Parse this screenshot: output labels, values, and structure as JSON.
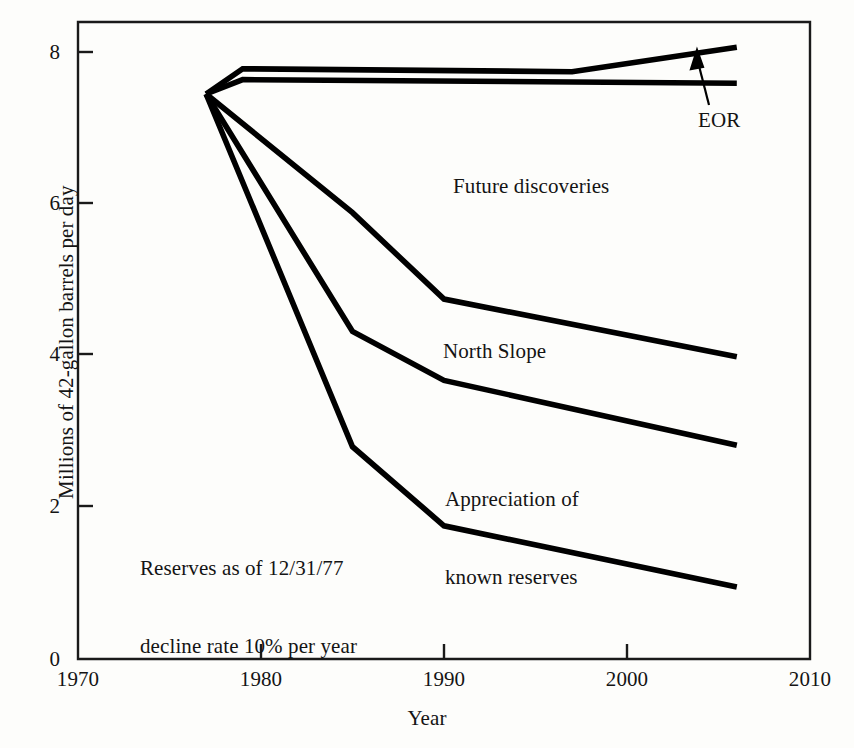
{
  "chart_data": {
    "type": "line",
    "title": "",
    "subtitle": "",
    "xlabel": "Year",
    "ylabel": "Millions of 42-gallon barrels per day",
    "xlim": [
      1970,
      2010
    ],
    "ylim": [
      0,
      8.85
    ],
    "xticks": [
      1970,
      1980,
      1990,
      2000,
      2010
    ],
    "yticks": [
      0,
      2,
      4,
      6,
      8
    ],
    "grid": false,
    "legend": "none (inline annotations)",
    "series": [
      {
        "name": "Total including EOR",
        "x": [
          1977,
          1979,
          1997,
          2006
        ],
        "values": [
          7.85,
          8.2,
          8.16,
          8.5
        ]
      },
      {
        "name": "EOR baseline",
        "x": [
          1977,
          1979,
          2006
        ],
        "values": [
          7.85,
          8.05,
          8.0
        ]
      },
      {
        "name": "Future discoveries",
        "x": [
          1977,
          1985,
          1990,
          2006
        ],
        "values": [
          7.85,
          6.2,
          5.0,
          4.2
        ]
      },
      {
        "name": "North Slope",
        "x": [
          1977,
          1985,
          1990,
          2006
        ],
        "values": [
          7.85,
          4.55,
          3.87,
          2.97
        ]
      },
      {
        "name": "Appreciation of known reserves",
        "x": [
          1977,
          1985,
          1990,
          2006
        ],
        "values": [
          7.85,
          2.95,
          1.85,
          1.0
        ]
      }
    ],
    "annotations": [
      {
        "text": "EOR",
        "x": 2000.5,
        "y": 7.45
      },
      {
        "text": "Future discoveries",
        "x": 1993.3,
        "y": 6.3
      },
      {
        "text": "North Slope",
        "x": 1992.0,
        "y": 4.12
      },
      {
        "text": "Appreciation of\nknown reserves",
        "x": 1992.5,
        "y": 3.0
      },
      {
        "text": "Reserves as of 12/31/77\ndecline rate 10% per year",
        "x": 1977.5,
        "y": 2.25
      }
    ]
  },
  "axes": {
    "y_ticks": [
      {
        "label": "8"
      },
      {
        "label": "6"
      },
      {
        "label": "4"
      },
      {
        "label": "2"
      },
      {
        "label": "0"
      }
    ],
    "x_ticks": [
      {
        "label": "1970"
      },
      {
        "label": "1980"
      },
      {
        "label": "1990"
      },
      {
        "label": "2000"
      },
      {
        "label": "2010"
      }
    ],
    "x_title": "Year",
    "y_title": "Millions of 42-gallon barrels per day"
  },
  "labels": {
    "eor": "EOR",
    "future_discoveries": "Future discoveries",
    "north_slope": "North Slope",
    "appreciation_line1": "Appreciation of",
    "appreciation_line2": "known reserves",
    "reserves_line1": "Reserves as of 12/31/77",
    "reserves_line2": "decline rate 10% per year"
  },
  "colors": {
    "line": "#000000",
    "axis": "#1a1a1a",
    "background": "#fdfdfb",
    "text": "#141414"
  }
}
